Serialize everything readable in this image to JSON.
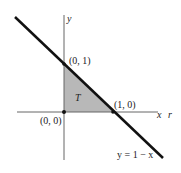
{
  "diagram": {
    "axes": {
      "x_label": "x",
      "x_label_extra": "r",
      "y_label": "y"
    },
    "region_label": "T",
    "points": {
      "origin": "(0, 0)",
      "y_intercept": "(0, 1)",
      "x_intercept": "(1, 0)"
    },
    "line_label": "y = 1 − x",
    "colors": {
      "region_fill": "#b8b8b8",
      "line": "#111111",
      "axis": "#666666"
    }
  }
}
